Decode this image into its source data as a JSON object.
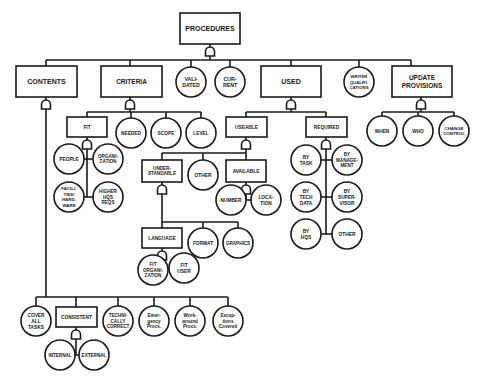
{
  "diagram": {
    "title": "PROCEDURES",
    "colors": {
      "stroke": "#1a1a1a",
      "fill": "#ffffff",
      "background": "#ffffff"
    },
    "nodes": [
      {
        "id": "procedures",
        "shape": "rect",
        "x": 180,
        "y": 13,
        "w": 60,
        "h": 31,
        "fs": 7,
        "lines": [
          "PROCEDURES"
        ]
      },
      {
        "id": "contents",
        "shape": "rect",
        "x": 16,
        "y": 66,
        "w": 61,
        "h": 31,
        "fs": 7,
        "lines": [
          "CONTENTS"
        ]
      },
      {
        "id": "criteria",
        "shape": "rect",
        "x": 101,
        "y": 66,
        "w": 61,
        "h": 31,
        "fs": 6.5,
        "lines": [
          "CRITERIA"
        ]
      },
      {
        "id": "validated",
        "shape": "circle",
        "cx": 191,
        "cy": 82,
        "r": 15,
        "fs": 5.2,
        "lines": [
          "VALI-",
          "DATED"
        ]
      },
      {
        "id": "current",
        "shape": "circle",
        "cx": 230,
        "cy": 82,
        "r": 15,
        "fs": 5.2,
        "lines": [
          "CUR-",
          "RENT"
        ]
      },
      {
        "id": "used",
        "shape": "rect",
        "x": 261,
        "y": 66,
        "w": 60,
        "h": 31,
        "fs": 7,
        "lines": [
          "USED"
        ]
      },
      {
        "id": "writer-qualifications",
        "shape": "circle",
        "cx": 359,
        "cy": 82,
        "r": 15,
        "fs": 4.3,
        "lines": [
          "WRITER",
          "QUALIFI-",
          "CATIONS"
        ]
      },
      {
        "id": "update-provisions",
        "shape": "rect",
        "x": 392,
        "y": 66,
        "w": 60,
        "h": 31,
        "fs": 6.5,
        "lines": [
          "UPDATE",
          "PROVISIONS"
        ]
      },
      {
        "id": "fit",
        "shape": "rect",
        "x": 67,
        "y": 117,
        "w": 40,
        "h": 20,
        "fs": 4.8,
        "lines": [
          "FIT"
        ]
      },
      {
        "id": "needed",
        "shape": "circle",
        "cx": 131,
        "cy": 133,
        "r": 15,
        "fs": 4.8,
        "lines": [
          "NEEDED"
        ]
      },
      {
        "id": "scope",
        "shape": "circle",
        "cx": 166,
        "cy": 133,
        "r": 15,
        "fs": 4.8,
        "lines": [
          "SCOPE"
        ]
      },
      {
        "id": "level",
        "shape": "circle",
        "cx": 201,
        "cy": 133,
        "r": 15,
        "fs": 4.8,
        "lines": [
          "LEVEL"
        ]
      },
      {
        "id": "people",
        "shape": "circle",
        "cx": 69,
        "cy": 159,
        "r": 15,
        "fs": 4.8,
        "lines": [
          "PEOPLE"
        ]
      },
      {
        "id": "organization",
        "shape": "circle",
        "cx": 108,
        "cy": 159,
        "r": 15,
        "fs": 4.6,
        "lines": [
          "ORGANI-",
          "ZATION"
        ]
      },
      {
        "id": "facilities-hardware",
        "shape": "circle",
        "cx": 69,
        "cy": 197,
        "r": 15,
        "fs": 4.4,
        "lines": [
          "FACILI-",
          "TIES/",
          "HARD-",
          "WARE"
        ]
      },
      {
        "id": "higher-hqs-reqs",
        "shape": "circle",
        "cx": 108,
        "cy": 197,
        "r": 15,
        "fs": 4.6,
        "lines": [
          "HIGHER",
          "HQS",
          "REQS"
        ]
      },
      {
        "id": "useable",
        "shape": "rect",
        "x": 226,
        "y": 117,
        "w": 41,
        "h": 20,
        "fs": 4.8,
        "lines": [
          "USEABLE"
        ]
      },
      {
        "id": "required",
        "shape": "rect",
        "x": 306,
        "y": 117,
        "w": 41,
        "h": 20,
        "fs": 4.8,
        "lines": [
          "REQUIRED"
        ]
      },
      {
        "id": "when",
        "shape": "circle",
        "cx": 382,
        "cy": 131,
        "r": 15,
        "fs": 4.8,
        "lines": [
          "WHEN"
        ]
      },
      {
        "id": "who",
        "shape": "circle",
        "cx": 418,
        "cy": 131,
        "r": 15,
        "fs": 4.8,
        "lines": [
          "WHO"
        ]
      },
      {
        "id": "change-control",
        "shape": "circle",
        "cx": 454,
        "cy": 131,
        "r": 15,
        "fs": 4.4,
        "lines": [
          "CHANGE",
          "CONTROL"
        ]
      },
      {
        "id": "understandable",
        "shape": "rect",
        "x": 142,
        "y": 160,
        "w": 40,
        "h": 22,
        "fs": 4.6,
        "lines": [
          "UNDER-",
          "STANDABLE"
        ]
      },
      {
        "id": "other-useable",
        "shape": "circle",
        "cx": 203,
        "cy": 175,
        "r": 15,
        "fs": 4.8,
        "lines": [
          "OTHER"
        ]
      },
      {
        "id": "available",
        "shape": "rect",
        "x": 226,
        "y": 160,
        "w": 40,
        "h": 22,
        "fs": 4.8,
        "lines": [
          "AVAILABLE"
        ]
      },
      {
        "id": "number",
        "shape": "circle",
        "cx": 231,
        "cy": 200,
        "r": 15,
        "fs": 4.8,
        "lines": [
          "NUMBER"
        ]
      },
      {
        "id": "location",
        "shape": "circle",
        "cx": 266,
        "cy": 200,
        "r": 15,
        "fs": 4.8,
        "lines": [
          "LOCA-",
          "TION"
        ]
      },
      {
        "id": "by-task",
        "shape": "circle",
        "cx": 306,
        "cy": 160,
        "r": 15,
        "fs": 4.8,
        "lines": [
          "BY",
          "TASK"
        ]
      },
      {
        "id": "by-management",
        "shape": "circle",
        "cx": 347,
        "cy": 160,
        "r": 15,
        "fs": 4.6,
        "lines": [
          "BY",
          "MANAGE-",
          "MENT"
        ]
      },
      {
        "id": "by-tech-data",
        "shape": "circle",
        "cx": 306,
        "cy": 197,
        "r": 15,
        "fs": 4.8,
        "lines": [
          "BY",
          "TECH",
          "DATA"
        ]
      },
      {
        "id": "by-supervisor",
        "shape": "circle",
        "cx": 347,
        "cy": 197,
        "r": 15,
        "fs": 4.8,
        "lines": [
          "BY",
          "SUPER-",
          "VISOR"
        ]
      },
      {
        "id": "by-hqs",
        "shape": "circle",
        "cx": 306,
        "cy": 234,
        "r": 15,
        "fs": 4.8,
        "lines": [
          "BY",
          "HQS"
        ]
      },
      {
        "id": "other-required",
        "shape": "circle",
        "cx": 347,
        "cy": 234,
        "r": 15,
        "fs": 4.8,
        "lines": [
          "OTHER"
        ]
      },
      {
        "id": "language",
        "shape": "rect",
        "x": 142,
        "y": 228,
        "w": 40,
        "h": 20,
        "fs": 4.8,
        "lines": [
          "LANGUAGE"
        ]
      },
      {
        "id": "format",
        "shape": "circle",
        "cx": 203,
        "cy": 243,
        "r": 15,
        "fs": 4.8,
        "lines": [
          "FORMAT"
        ]
      },
      {
        "id": "graphics",
        "shape": "circle",
        "cx": 238,
        "cy": 243,
        "r": 15,
        "fs": 4.6,
        "lines": [
          "GRAPHICS"
        ]
      },
      {
        "id": "fit-organization",
        "shape": "circle",
        "cx": 153,
        "cy": 270,
        "r": 15,
        "fs": 4.6,
        "lines": [
          "FIT",
          "ORGANI-",
          "ZATION"
        ]
      },
      {
        "id": "fit-user",
        "shape": "circle",
        "cx": 184,
        "cy": 268,
        "r": 15,
        "fs": 4.8,
        "lines": [
          "FIT",
          "USER"
        ]
      },
      {
        "id": "cover-all-tasks",
        "shape": "circle",
        "cx": 36,
        "cy": 321,
        "r": 15,
        "fs": 4.8,
        "lines": [
          "COVER",
          "ALL",
          "TASKS"
        ]
      },
      {
        "id": "consistent",
        "shape": "rect",
        "x": 56,
        "y": 307,
        "w": 41,
        "h": 20,
        "fs": 4.8,
        "lines": [
          "CONSISTENT"
        ]
      },
      {
        "id": "technically-correct",
        "shape": "circle",
        "cx": 118,
        "cy": 321,
        "r": 15,
        "fs": 4.6,
        "lines": [
          "TECHNI-",
          "CALLY",
          "CORRECT"
        ]
      },
      {
        "id": "emergency-procs",
        "shape": "circle",
        "cx": 154,
        "cy": 321,
        "r": 15,
        "fs": 4.6,
        "lines": [
          "Emer-",
          "gency",
          "Procs."
        ]
      },
      {
        "id": "workaround-procs",
        "shape": "circle",
        "cx": 190,
        "cy": 321,
        "r": 15,
        "fs": 4.6,
        "lines": [
          "Work-",
          "around",
          "Procs."
        ]
      },
      {
        "id": "exceptions-covered",
        "shape": "circle",
        "cx": 228,
        "cy": 321,
        "r": 15,
        "fs": 4.6,
        "lines": [
          "Excep-",
          "tions",
          "Covered"
        ]
      },
      {
        "id": "internal",
        "shape": "circle",
        "cx": 60,
        "cy": 355,
        "r": 15,
        "fs": 4.6,
        "lines": [
          "INTERNAL"
        ]
      },
      {
        "id": "external",
        "shape": "circle",
        "cx": 94,
        "cy": 355,
        "r": 15,
        "fs": 4.6,
        "lines": [
          "EXTERNAL"
        ]
      }
    ],
    "gates": [
      {
        "of": "procedures",
        "cx": 210,
        "y": 47
      },
      {
        "of": "contents",
        "cx": 46,
        "y": 100
      },
      {
        "of": "criteria",
        "cx": 130,
        "y": 100
      },
      {
        "of": "used",
        "cx": 291,
        "y": 100
      },
      {
        "of": "update-provisions",
        "cx": 421,
        "y": 100
      },
      {
        "of": "fit",
        "cx": 87,
        "y": 140
      },
      {
        "of": "useable",
        "cx": 246,
        "y": 140
      },
      {
        "of": "required",
        "cx": 326,
        "y": 140
      },
      {
        "of": "understandable",
        "cx": 162,
        "y": 185
      },
      {
        "of": "available",
        "cx": 246,
        "y": 185
      },
      {
        "of": "language",
        "cx": 162,
        "y": 251
      },
      {
        "of": "consistent",
        "cx": 76,
        "y": 330
      }
    ],
    "lines": [
      [
        210,
        44,
        210,
        47
      ],
      [
        210,
        56,
        210,
        60
      ],
      [
        46,
        60,
        411,
        60
      ],
      [
        46,
        60,
        46,
        66
      ],
      [
        130,
        60,
        130,
        66
      ],
      [
        191,
        60,
        191,
        67
      ],
      [
        230,
        60,
        230,
        67
      ],
      [
        291,
        60,
        291,
        66
      ],
      [
        359,
        60,
        359,
        67
      ],
      [
        411,
        60,
        411,
        66
      ],
      [
        210,
        13,
        210,
        13
      ],
      [
        46,
        97,
        46,
        100
      ],
      [
        130,
        97,
        130,
        100
      ],
      [
        291,
        97,
        291,
        100
      ],
      [
        421,
        97,
        421,
        100
      ],
      [
        130,
        109,
        130,
        112
      ],
      [
        87,
        112,
        201,
        112
      ],
      [
        87,
        112,
        87,
        117
      ],
      [
        131,
        112,
        131,
        118
      ],
      [
        166,
        112,
        166,
        118
      ],
      [
        201,
        112,
        201,
        118
      ],
      [
        87,
        137,
        87,
        140
      ],
      [
        87,
        149,
        87,
        197
      ],
      [
        84,
        159,
        93,
        159
      ],
      [
        84,
        197,
        93,
        197
      ],
      [
        291,
        109,
        291,
        112
      ],
      [
        246,
        112,
        326,
        112
      ],
      [
        246,
        112,
        246,
        117
      ],
      [
        326,
        112,
        326,
        117
      ],
      [
        246,
        137,
        246,
        140
      ],
      [
        246,
        149,
        246,
        153
      ],
      [
        162,
        153,
        246,
        153
      ],
      [
        162,
        153,
        162,
        160
      ],
      [
        203,
        153,
        203,
        160
      ],
      [
        246,
        153,
        246,
        160
      ],
      [
        326,
        137,
        326,
        140
      ],
      [
        326,
        149,
        326,
        234
      ],
      [
        321,
        160,
        332,
        160
      ],
      [
        321,
        197,
        332,
        197
      ],
      [
        321,
        234,
        332,
        234
      ],
      [
        421,
        109,
        421,
        112
      ],
      [
        382,
        112,
        454,
        112
      ],
      [
        382,
        112,
        382,
        116
      ],
      [
        418,
        112,
        418,
        116
      ],
      [
        454,
        112,
        454,
        116
      ],
      [
        246,
        182,
        246,
        185
      ],
      [
        246,
        194,
        246,
        200
      ],
      [
        246,
        200,
        251,
        200
      ],
      [
        162,
        182,
        162,
        185
      ],
      [
        162,
        194,
        162,
        222
      ],
      [
        162,
        222,
        238,
        222
      ],
      [
        162,
        222,
        162,
        228
      ],
      [
        203,
        222,
        203,
        228
      ],
      [
        238,
        222,
        238,
        228
      ],
      [
        162,
        248,
        162,
        251
      ],
      [
        162,
        260,
        162,
        268
      ],
      [
        162,
        268,
        169,
        268
      ],
      [
        46,
        109,
        46,
        297
      ],
      [
        36,
        297,
        228,
        297
      ],
      [
        36,
        297,
        36,
        306
      ],
      [
        76,
        297,
        76,
        307
      ],
      [
        118,
        297,
        118,
        306
      ],
      [
        154,
        297,
        154,
        306
      ],
      [
        190,
        297,
        190,
        306
      ],
      [
        228,
        297,
        228,
        306
      ],
      [
        76,
        327,
        76,
        330
      ],
      [
        76,
        339,
        76,
        355
      ],
      [
        75,
        355,
        79,
        355
      ]
    ]
  }
}
